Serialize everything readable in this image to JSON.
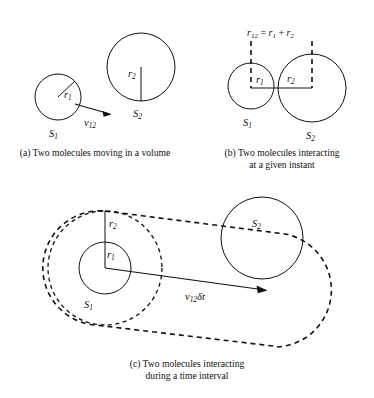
{
  "figure": {
    "background_color": "#ffffff",
    "stroke_color": "#111111",
    "panels": [
      {
        "key": "a",
        "caption": "(a) Two molecules moving in a volume",
        "labels": {
          "circle_small": "S1",
          "circle_large": "S2",
          "radius_small": "r1",
          "radius_large": "r2",
          "velocity": "v12"
        }
      },
      {
        "key": "b",
        "caption": "(b) Two molecules interacting\nat a given instant",
        "labels": {
          "circle_small": "S1",
          "circle_large": "S2",
          "radius_small": "r1",
          "radius_large": "r2",
          "equation": "r12 = r1 + r2"
        }
      },
      {
        "key": "c",
        "caption": "(c) Two molecules interacting\nduring a time interval",
        "labels": {
          "circle_small": "S1",
          "circle_large": "S2",
          "radius_small": "r1",
          "radius_large": "r2",
          "displacement": "v12 δt"
        }
      }
    ],
    "symbols": {
      "S": "S",
      "r": "r",
      "v": "v",
      "delta_t": "δt",
      "equals": " = ",
      "plus": " + ",
      "sub_1": "1",
      "sub_2": "2",
      "sub_12": "12"
    }
  }
}
